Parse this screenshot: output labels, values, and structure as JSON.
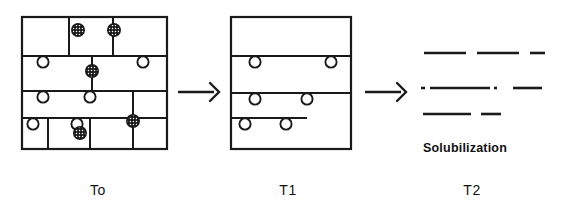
{
  "figure": {
    "width": 561,
    "height": 213,
    "background": "#ffffff",
    "ink_color": "#1a1a1a"
  },
  "stages": [
    {
      "id": "t0",
      "label": "To",
      "label_x": 98,
      "label_y": 182,
      "panel": {
        "x": 22,
        "y": 17,
        "width": 145,
        "height": 132,
        "border_width": 2.2
      },
      "internal_lines": [
        {
          "name": "row-divider-1",
          "x1": 22,
          "y1": 56,
          "x2": 167,
          "y2": 56
        },
        {
          "name": "row-divider-2",
          "x1": 22,
          "y1": 91,
          "x2": 167,
          "y2": 91
        },
        {
          "name": "row-divider-3",
          "x1": 22,
          "y1": 118,
          "x2": 167,
          "y2": 118
        },
        {
          "name": "seg-top-a",
          "x1": 69,
          "y1": 17,
          "x2": 69,
          "y2": 56
        },
        {
          "name": "seg-top-b",
          "x1": 113,
          "y1": 17,
          "x2": 113,
          "y2": 56
        },
        {
          "name": "seg-mid-a",
          "x1": 92,
          "y1": 56,
          "x2": 92,
          "y2": 91
        },
        {
          "name": "seg-low-a",
          "x1": 133,
          "y1": 91,
          "x2": 133,
          "y2": 149
        },
        {
          "name": "seg-low-b",
          "x1": 48,
          "y1": 118,
          "x2": 48,
          "y2": 149
        },
        {
          "name": "seg-low-c",
          "x1": 90,
          "y1": 118,
          "x2": 90,
          "y2": 149
        },
        {
          "name": "short-bar-low",
          "x1": 27,
          "y1": 118,
          "x2": 90,
          "y2": 118
        }
      ],
      "open_particles": [
        {
          "cx": 43,
          "cy": 62,
          "r": 5.6
        },
        {
          "cx": 143,
          "cy": 62,
          "r": 5.6
        },
        {
          "cx": 43,
          "cy": 97,
          "r": 5.6
        },
        {
          "cx": 90,
          "cy": 97,
          "r": 5.6
        },
        {
          "cx": 33,
          "cy": 124,
          "r": 5.6
        },
        {
          "cx": 77,
          "cy": 124,
          "r": 5.6
        }
      ],
      "filled_particles": [
        {
          "cx": 78,
          "cy": 30,
          "r": 6.2
        },
        {
          "cx": 114,
          "cy": 30,
          "r": 6.2
        },
        {
          "cx": 92,
          "cy": 71,
          "r": 6.2
        },
        {
          "cx": 133,
          "cy": 121,
          "r": 6.2
        },
        {
          "cx": 80,
          "cy": 133,
          "r": 6.2
        }
      ]
    },
    {
      "id": "t1",
      "label": "T1",
      "label_x": 288,
      "label_y": 182,
      "panel": {
        "x": 231,
        "y": 17,
        "width": 120,
        "height": 132,
        "border_width": 2.2
      },
      "internal_lines": [
        {
          "name": "row-divider-1",
          "x1": 231,
          "y1": 56,
          "x2": 351,
          "y2": 56
        },
        {
          "name": "row-divider-2",
          "x1": 231,
          "y1": 93,
          "x2": 351,
          "y2": 93
        },
        {
          "name": "short-bar-low",
          "x1": 231,
          "y1": 118,
          "x2": 307,
          "y2": 118
        }
      ],
      "open_particles": [
        {
          "cx": 255,
          "cy": 62,
          "r": 5.6
        },
        {
          "cx": 331,
          "cy": 62,
          "r": 5.6
        },
        {
          "cx": 255,
          "cy": 99,
          "r": 5.6
        },
        {
          "cx": 307,
          "cy": 99,
          "r": 5.6
        },
        {
          "cx": 245,
          "cy": 124,
          "r": 5.6
        },
        {
          "cx": 286,
          "cy": 124,
          "r": 5.6
        }
      ],
      "filled_particles": []
    },
    {
      "id": "t2",
      "label": "T2",
      "label_x": 472,
      "label_y": 182,
      "caption": "Solubilization",
      "caption_x": 423,
      "caption_y": 141,
      "fragment_rows": [
        {
          "name": "fragment-row-1",
          "y": 53,
          "dashes": [
            {
              "x1": 424,
              "x2": 466
            },
            {
              "x1": 477,
              "x2": 519
            },
            {
              "x1": 530,
              "x2": 545
            }
          ]
        },
        {
          "name": "fragment-row-2",
          "y": 88,
          "dashes": [
            {
              "x1": 421,
              "x2": 425
            },
            {
              "x1": 430,
              "x2": 490
            },
            {
              "x1": 494,
              "x2": 497
            },
            {
              "x1": 513,
              "x2": 542
            }
          ]
        },
        {
          "name": "fragment-row-3",
          "y": 114,
          "dashes": [
            {
              "x1": 423,
              "x2": 471
            },
            {
              "x1": 481,
              "x2": 501
            }
          ]
        }
      ]
    }
  ],
  "arrows": [
    {
      "id": "arrow-t0-t1",
      "x1": 178,
      "y1": 92,
      "x2": 219,
      "y2": 92,
      "head_size": 9
    },
    {
      "id": "arrow-t1-t2",
      "x1": 365,
      "y1": 92,
      "x2": 406,
      "y2": 92,
      "head_size": 9
    }
  ]
}
